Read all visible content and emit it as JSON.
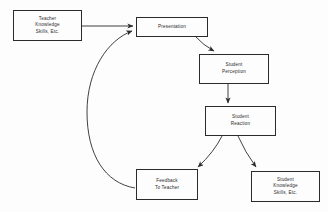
{
  "diagram": {
    "type": "flowchart",
    "background_color": "#fdfdfd",
    "line_color": "#2b2b2b",
    "text_color": "#2a2a2a",
    "nodes": [
      {
        "id": "teacher",
        "lines": [
          "Teacher",
          "Knowledge",
          "Skills, Etc."
        ],
        "x": 13,
        "y": 10,
        "w": 69,
        "h": 31
      },
      {
        "id": "presentation",
        "lines": [
          "Presentation"
        ],
        "x": 136,
        "y": 17,
        "w": 72,
        "h": 20
      },
      {
        "id": "student-perception",
        "lines": [
          "Student",
          "Perception"
        ],
        "x": 199,
        "y": 54,
        "w": 70,
        "h": 30
      },
      {
        "id": "student-reaction",
        "lines": [
          "Student",
          "Reaction"
        ],
        "x": 205,
        "y": 106,
        "w": 71,
        "h": 30
      },
      {
        "id": "feedback-to-teacher",
        "lines": [
          "Feedback",
          "To Teacher"
        ],
        "x": 136,
        "y": 169,
        "w": 62,
        "h": 31
      },
      {
        "id": "student-knowledge",
        "lines": [
          "Student",
          "Knowledge",
          "Skills, Etc."
        ],
        "x": 251,
        "y": 171,
        "w": 69,
        "h": 31
      }
    ],
    "edges": [
      {
        "id": "teacher-to-presentation",
        "from": "teacher",
        "to": "presentation",
        "style": "straight"
      },
      {
        "id": "presentation-to-perception",
        "from": "presentation",
        "to": "student-perception",
        "style": "curved"
      },
      {
        "id": "perception-to-reaction",
        "from": "student-perception",
        "to": "student-reaction",
        "style": "straight"
      },
      {
        "id": "reaction-to-feedback",
        "from": "student-reaction",
        "to": "feedback-to-teacher",
        "style": "curved"
      },
      {
        "id": "reaction-to-knowledge",
        "from": "student-reaction",
        "to": "student-knowledge",
        "style": "curved"
      },
      {
        "id": "feedback-to-presentation",
        "from": "feedback-to-teacher",
        "to": "presentation",
        "style": "long-curve"
      }
    ]
  }
}
